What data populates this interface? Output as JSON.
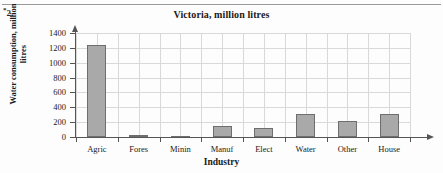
{
  "item_number": {
    "star": "*",
    "text": "2."
  },
  "chart_data": {
    "type": "bar",
    "title": "Victoria, million litres",
    "xlabel": "Industry",
    "ylabel": "Water consumption, million litres",
    "categories": [
      "Agric",
      "Fores",
      "Minin",
      "Manuf",
      "Elect",
      "Water",
      "Other",
      "House"
    ],
    "values": [
      1235,
      25,
      20,
      145,
      115,
      310,
      215,
      310
    ],
    "ylim": [
      0,
      1400
    ],
    "ytick_labels": [
      "0",
      "200",
      "400",
      "600",
      "800",
      "1000",
      "1200",
      "1400"
    ],
    "ytick_values": [
      0,
      200,
      400,
      600,
      800,
      1000,
      1200,
      1400
    ],
    "grid": true,
    "legend": false,
    "bar_fill_color": "#a9a9a9",
    "bar_edge_color": "#6e6e6e",
    "grid_color": "#d9d9d9",
    "axis_color": "#555555"
  }
}
